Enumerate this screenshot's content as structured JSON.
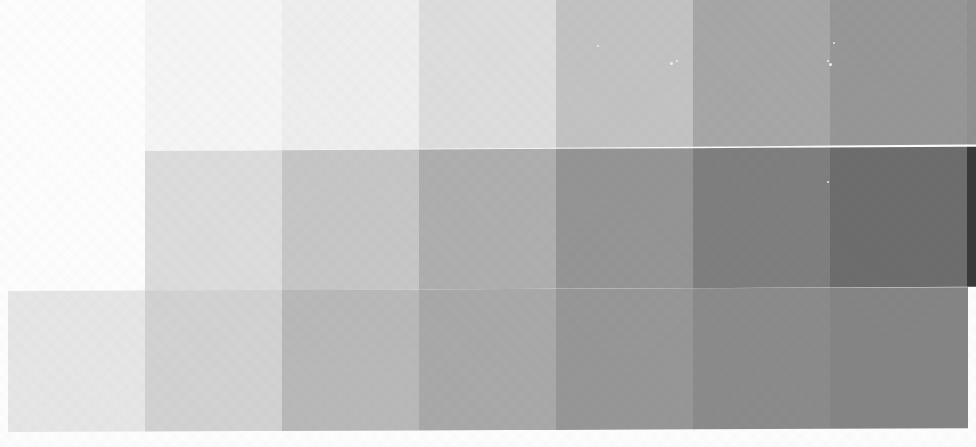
{
  "chart_data": {
    "type": "heatmap",
    "xlabel": "",
    "ylabel": "",
    "legend": "none",
    "grid": false,
    "columns": [
      "1",
      "2",
      "3",
      "4",
      "5",
      "6",
      "7"
    ],
    "rows": [
      "top",
      "middle",
      "bottom"
    ],
    "values": [
      [
        247,
        240,
        223,
        196,
        168,
        152,
        146
      ],
      [
        222,
        200,
        176,
        150,
        128,
        110,
        58
      ],
      [
        232,
        212,
        186,
        170,
        152,
        140,
        134
      ]
    ],
    "colors": [
      [
        "#f7f7f7",
        "#f0f0f0",
        "#dfdfdf",
        "#c4c4c4",
        "#a8a8a8",
        "#989898",
        "#929292"
      ],
      [
        "#dedede",
        "#c8c8c8",
        "#b0b0b0",
        "#969696",
        "#808080",
        "#6e6e6e",
        "#3a3a3a"
      ],
      [
        "#e8e8e8",
        "#d4d4d4",
        "#bababa",
        "#aaaaaa",
        "#989898",
        "#8c8c8c",
        "#868686"
      ]
    ],
    "bands": [
      {
        "name": "top-band",
        "x": 145,
        "y": 0,
        "width": 831,
        "height": 151,
        "cell_width": 137
      },
      {
        "name": "middle-band",
        "x": 145,
        "y": 151,
        "width": 831,
        "height": 140,
        "cell_width": 137
      },
      {
        "name": "bottom-band",
        "x": 8,
        "y": 291,
        "width": 960,
        "height": 141,
        "cell_width": 137
      }
    ],
    "background": "#ffffff",
    "canvas": {
      "width": 976,
      "height": 447
    }
  },
  "specks": [
    {
      "x": 670,
      "y": 62,
      "size": 3
    },
    {
      "x": 676,
      "y": 60,
      "size": 2
    },
    {
      "x": 829,
      "y": 63,
      "size": 3
    },
    {
      "x": 827,
      "y": 60,
      "size": 2
    },
    {
      "x": 827,
      "y": 181,
      "size": 2
    },
    {
      "x": 597,
      "y": 45,
      "size": 2
    },
    {
      "x": 176,
      "y": 44,
      "size": 2
    },
    {
      "x": 833,
      "y": 42,
      "size": 2
    }
  ]
}
